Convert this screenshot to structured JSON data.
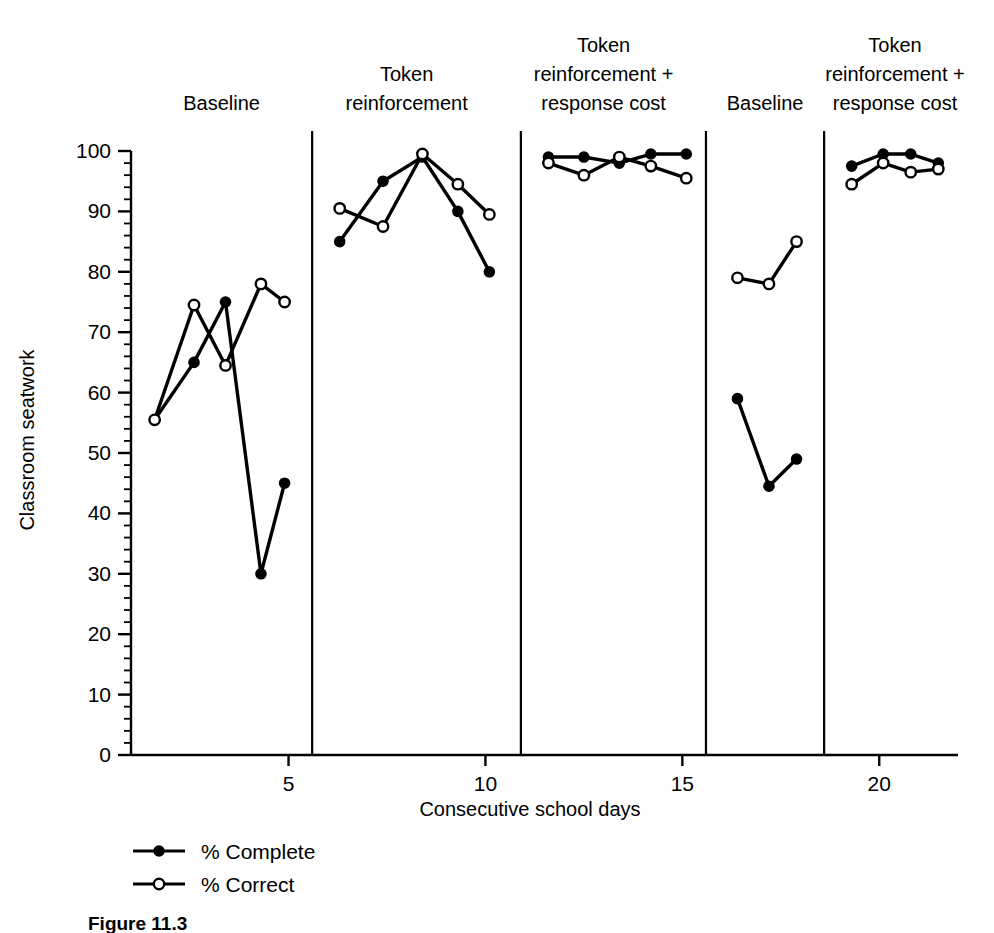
{
  "figure": {
    "caption": "Figure 11.3",
    "background": "#ffffff",
    "ink": "#000000"
  },
  "chart_data": {
    "type": "line",
    "title": "",
    "xlabel": "Consecutive school days",
    "ylabel": "Classroom seatwork",
    "xlim": [
      1,
      22
    ],
    "ylim": [
      0,
      100
    ],
    "yticks": [
      0,
      10,
      20,
      30,
      40,
      50,
      60,
      70,
      80,
      90,
      100
    ],
    "ytick_labels": [
      "0",
      "10",
      "20",
      "30",
      "40",
      "50",
      "60",
      "70",
      "80",
      "90",
      "100"
    ],
    "y_minor_tick_step": 2,
    "xticks": [
      5,
      10,
      15,
      20
    ],
    "xtick_labels": [
      "5",
      "10",
      "15",
      "20"
    ],
    "grid": false,
    "legend_position": "below-axes-left",
    "phase_dividers": [
      5.6,
      10.9,
      15.6,
      18.6
    ],
    "phases": [
      {
        "label": "Baseline",
        "x_start": 1,
        "x_end": 5.6,
        "label_x": 3.3,
        "label_lines": [
          "Baseline"
        ]
      },
      {
        "label": "Token reinforcement",
        "x_start": 5.6,
        "x_end": 10.9,
        "label_x": 8.0,
        "label_lines": [
          "Token",
          "reinforcement"
        ]
      },
      {
        "label": "Token reinforcement + response cost",
        "x_start": 10.9,
        "x_end": 15.6,
        "label_x": 13.0,
        "label_lines": [
          "Token",
          "reinforcement +",
          "response cost"
        ]
      },
      {
        "label": "Baseline",
        "x_start": 15.6,
        "x_end": 18.6,
        "label_x": 17.1,
        "label_lines": [
          "Baseline"
        ]
      },
      {
        "label": "Token reinforcement + response cost",
        "x_start": 18.6,
        "x_end": 22,
        "label_x": 20.4,
        "label_lines": [
          "Token",
          "reinforcement +",
          "response cost"
        ]
      }
    ],
    "series": [
      {
        "name": "% Complete",
        "marker": "filled-circle",
        "marker_fill": "#000000",
        "line_color": "#000000",
        "segments": [
          {
            "phase": "Baseline",
            "points": [
              [
                1.6,
                55.5
              ],
              [
                2.6,
                65
              ],
              [
                3.4,
                75
              ],
              [
                4.3,
                30
              ],
              [
                4.9,
                45
              ]
            ]
          },
          {
            "phase": "Token reinforcement",
            "points": [
              [
                6.3,
                85
              ],
              [
                7.4,
                95
              ],
              [
                8.4,
                99
              ],
              [
                9.3,
                90
              ],
              [
                10.1,
                80
              ]
            ]
          },
          {
            "phase": "Token reinforcement + response cost",
            "points": [
              [
                11.6,
                99
              ],
              [
                12.5,
                99
              ],
              [
                13.4,
                98
              ],
              [
                14.2,
                99.5
              ],
              [
                15.1,
                99.5
              ]
            ]
          },
          {
            "phase": "Baseline",
            "points": [
              [
                16.4,
                59
              ],
              [
                17.2,
                44.5
              ],
              [
                17.9,
                49
              ]
            ]
          },
          {
            "phase": "Token reinforcement + response cost",
            "points": [
              [
                19.3,
                97.5
              ],
              [
                20.1,
                99.5
              ],
              [
                20.8,
                99.5
              ],
              [
                21.5,
                98
              ]
            ]
          }
        ]
      },
      {
        "name": "% Correct",
        "marker": "open-circle",
        "marker_fill": "#ffffff",
        "line_color": "#000000",
        "segments": [
          {
            "phase": "Baseline",
            "points": [
              [
                1.6,
                55.5
              ],
              [
                2.6,
                74.5
              ],
              [
                3.4,
                64.5
              ],
              [
                4.3,
                78
              ],
              [
                4.9,
                75
              ]
            ]
          },
          {
            "phase": "Token reinforcement",
            "points": [
              [
                6.3,
                90.5
              ],
              [
                7.4,
                87.5
              ],
              [
                8.4,
                99.5
              ],
              [
                9.3,
                94.5
              ],
              [
                10.1,
                89.5
              ]
            ]
          },
          {
            "phase": "Token reinforcement + response cost",
            "points": [
              [
                11.6,
                98
              ],
              [
                12.5,
                96
              ],
              [
                13.4,
                99
              ],
              [
                14.2,
                97.5
              ],
              [
                15.1,
                95.5
              ]
            ]
          },
          {
            "phase": "Baseline",
            "points": [
              [
                16.4,
                79
              ],
              [
                17.2,
                78
              ],
              [
                17.9,
                85
              ]
            ]
          },
          {
            "phase": "Token reinforcement + response cost",
            "points": [
              [
                19.3,
                94.5
              ],
              [
                20.1,
                98
              ],
              [
                20.8,
                96.5
              ],
              [
                21.5,
                97
              ]
            ]
          }
        ]
      }
    ],
    "legend": [
      {
        "label": "% Complete",
        "marker": "filled-circle"
      },
      {
        "label": "% Correct",
        "marker": "open-circle"
      }
    ]
  }
}
